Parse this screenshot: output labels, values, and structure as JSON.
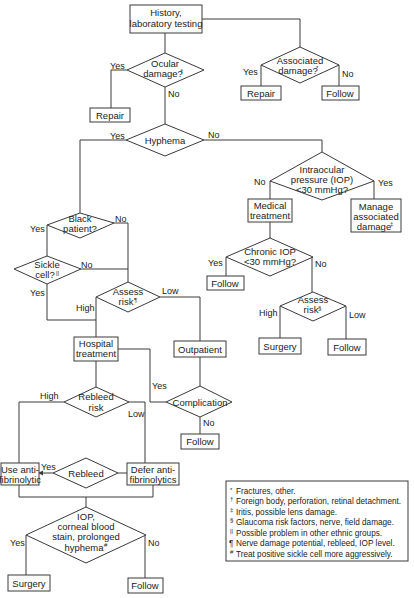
{
  "nodes": {
    "history": [
      "History,",
      "laboratory testing"
    ],
    "ocular_damage": [
      "Ocular",
      "damage?"
    ],
    "ocular_damage_sup": "†",
    "repair_1": "Repair",
    "associated_damage": [
      "Associated",
      "damage?"
    ],
    "associated_damage_sup": "*",
    "repair_2": "Repair",
    "follow_1": "Follow",
    "hyphema": "Hyphema",
    "iop": [
      "Intraocular",
      "pressure (IOP)",
      "<30 mmHg?"
    ],
    "manage": [
      "Manage",
      "associated",
      "damage"
    ],
    "manage_sup": "‡",
    "medical": [
      "Medical",
      "treatment"
    ],
    "chronic_iop": [
      "Chronic IOP",
      "<30 mmHg?"
    ],
    "follow_2": "Follow",
    "assess_risk_glaucoma": [
      "Assess",
      "risk"
    ],
    "assess_risk_glaucoma_sup": "§",
    "surgery_1": "Surgery",
    "follow_3": "Follow",
    "black_patient": [
      "Black",
      "patient?"
    ],
    "sickle_cell": [
      "Sickle",
      "cell?"
    ],
    "sickle_cell_sup": "||",
    "assess_risk": [
      "Assess",
      "risk"
    ],
    "assess_risk_sup": "¶",
    "hospital": [
      "Hospital",
      "treatment"
    ],
    "outpatient": "Outpatient",
    "complication": "Complication",
    "follow_4": "Follow",
    "rebleed_risk": [
      "Rebleed",
      "risk"
    ],
    "use_antifibrinolytic": [
      "Use anti-",
      "fibrinolytic"
    ],
    "rebleed": "Rebleed",
    "defer_antifibrinolytics": [
      "Defer anti-",
      "fibrinolytics"
    ],
    "final_decision": [
      "IOP,",
      "corneal blood",
      "stain, prolonged",
      "hyphema"
    ],
    "final_decision_sup": "#",
    "surgery_2": "Surgery",
    "follow_5": "Follow"
  },
  "edge_labels": {
    "yes": "Yes",
    "no": "No",
    "high": "High",
    "low": "Low"
  },
  "legend": [
    {
      "mark": "*",
      "text": "Fractures, other."
    },
    {
      "mark": "†",
      "text": "Foreign body, perforation, retinal detachment."
    },
    {
      "mark": "‡",
      "text": "Iritis, possible lens damage."
    },
    {
      "mark": "§",
      "text": "Glaucoma risk factors, nerve, field damage."
    },
    {
      "mark": "||",
      "text": "Possible problem in other ethnic groups."
    },
    {
      "mark": "¶",
      "text": "Nerve damage potential, rebleed, IOP level."
    },
    {
      "mark": "#",
      "text": "Treat positive sickle cell more aggressively."
    }
  ]
}
